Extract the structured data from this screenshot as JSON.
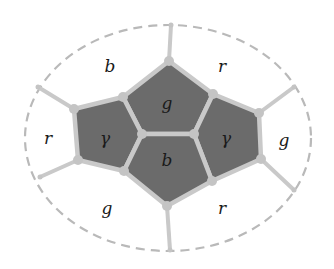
{
  "diagram": {
    "type": "graph-coloring-cells",
    "colors": {
      "inner_fill": "#6b6b6b",
      "edge": "#c9c9c9",
      "vertex": "#c4c4c4",
      "ellipse": "#b9b9b9",
      "text": "#1a1a1a"
    },
    "ellipse": {
      "cx": 168,
      "cy": 138,
      "rx": 143,
      "ry": 113
    },
    "inner_cells": [
      {
        "id": "top",
        "label": "g",
        "points": "169,61 213,94 194,134 142,134 123,97",
        "lx": 167,
        "ly": 109
      },
      {
        "id": "left",
        "label": "γ",
        "points": "74,109 123,97 142,134 124,171 78,160",
        "lx": 105,
        "ly": 144
      },
      {
        "id": "right",
        "label": "γ",
        "points": "213,94 259,113 261,159 212,181 194,134",
        "lx": 226,
        "ly": 144
      },
      {
        "id": "bottom",
        "label": "b",
        "points": "142,134 194,134 212,181 167,206 124,171",
        "lx": 167,
        "ly": 166
      }
    ],
    "outer_regions": [
      {
        "id": "top-left",
        "label": "b",
        "lx": 110,
        "ly": 72
      },
      {
        "id": "top-right",
        "label": "r",
        "lx": 222,
        "ly": 72
      },
      {
        "id": "left",
        "label": "r",
        "lx": 48,
        "ly": 144
      },
      {
        "id": "right",
        "label": "g",
        "lx": 284,
        "ly": 146
      },
      {
        "id": "bottom-left",
        "label": "g",
        "lx": 107,
        "ly": 214
      },
      {
        "id": "bottom-right",
        "label": "r",
        "lx": 222,
        "ly": 214
      }
    ],
    "spokes": [
      {
        "x1": 169,
        "y1": 61,
        "x2": 171,
        "y2": 25
      },
      {
        "x1": 74,
        "y1": 109,
        "x2": 38,
        "y2": 87
      },
      {
        "x1": 78,
        "y1": 160,
        "x2": 40,
        "y2": 177
      },
      {
        "x1": 259,
        "y1": 113,
        "x2": 294,
        "y2": 87
      },
      {
        "x1": 261,
        "y1": 159,
        "x2": 294,
        "y2": 190
      },
      {
        "x1": 167,
        "y1": 206,
        "x2": 170,
        "y2": 250
      }
    ]
  }
}
